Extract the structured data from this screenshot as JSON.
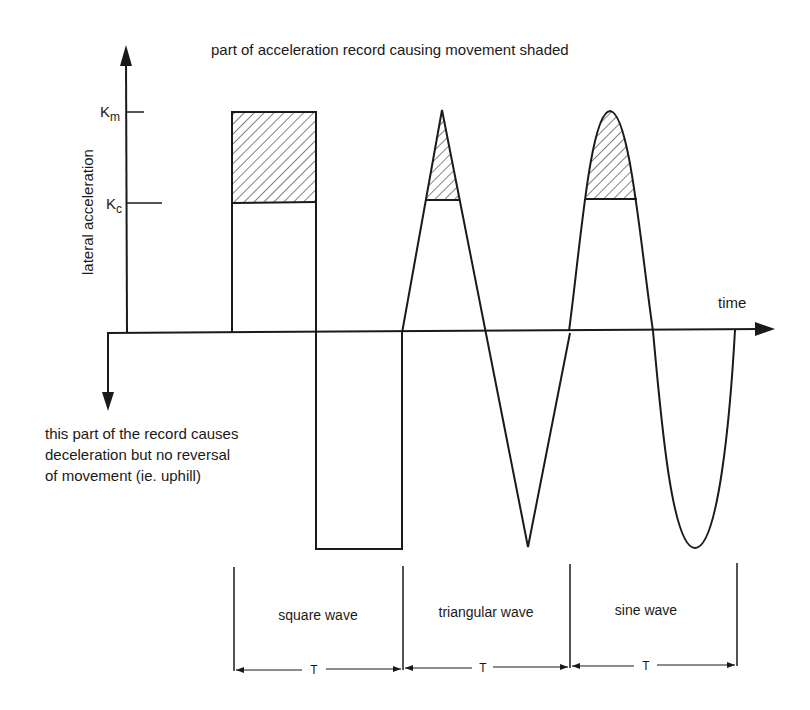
{
  "title": "part of acceleration record causing movement shaded",
  "axes": {
    "y_label": "lateral acceleration",
    "x_label": "time",
    "km_label": "K",
    "km_sub": "m",
    "kc_label": "K",
    "kc_sub": "c"
  },
  "annotation": {
    "lines": [
      "this part of the record causes",
      "deceleration but no reversal",
      "of movement (ie. uphill)"
    ]
  },
  "segments": [
    {
      "label": "square wave",
      "period": "T"
    },
    {
      "label": "triangular wave",
      "period": "T"
    },
    {
      "label": "sine wave",
      "period": "T"
    }
  ],
  "colors": {
    "ink": "#1a1a1a",
    "background": "#ffffff"
  }
}
